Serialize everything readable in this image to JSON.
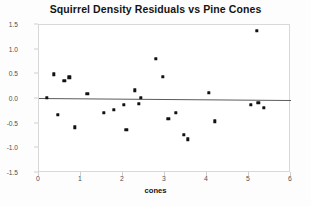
{
  "chart_data": {
    "type": "scatter",
    "title": "Squirrel Density Residuals vs Pine Cones",
    "xlabel": "cones",
    "ylabel": "Residual",
    "xlim": [
      0,
      6
    ],
    "ylim": [
      -1.5,
      1.5
    ],
    "xticks": [
      "0",
      "1",
      "2",
      "3",
      "4",
      "5",
      "6"
    ],
    "xtick_values": [
      0,
      1,
      2,
      3,
      4,
      5,
      6
    ],
    "yticks": [
      "-1.5",
      "-1.0",
      "-0.5",
      "0.0",
      "0.5",
      "1.0",
      "1.5"
    ],
    "ytick_values": [
      -1.5,
      -1.0,
      -0.5,
      0.0,
      0.5,
      1.0,
      1.5
    ],
    "grid": false,
    "legend": null,
    "marker_color": "#111111",
    "reference_line": {
      "name": "zero-residual-line",
      "y_left": 0.02,
      "y_right": -0.02,
      "color": "#5a5a5a"
    },
    "points": [
      {
        "x": 0.18,
        "y": 0.02
      },
      {
        "x": 0.35,
        "y": 0.5
      },
      {
        "x": 0.45,
        "y": -0.32
      },
      {
        "x": 0.6,
        "y": 0.37
      },
      {
        "x": 0.72,
        "y": 0.44
      },
      {
        "x": 0.85,
        "y": -0.57
      },
      {
        "x": 1.15,
        "y": 0.1
      },
      {
        "x": 1.55,
        "y": -0.28
      },
      {
        "x": 1.78,
        "y": -0.22
      },
      {
        "x": 2.02,
        "y": -0.12
      },
      {
        "x": 2.08,
        "y": -0.62
      },
      {
        "x": 2.28,
        "y": 0.18
      },
      {
        "x": 2.38,
        "y": -0.1
      },
      {
        "x": 2.42,
        "y": 0.02
      },
      {
        "x": 2.78,
        "y": 0.82
      },
      {
        "x": 2.95,
        "y": 0.45
      },
      {
        "x": 3.08,
        "y": -0.4
      },
      {
        "x": 3.25,
        "y": -0.28
      },
      {
        "x": 3.45,
        "y": -0.72
      },
      {
        "x": 3.55,
        "y": -0.82
      },
      {
        "x": 4.05,
        "y": 0.12
      },
      {
        "x": 4.18,
        "y": -0.45
      },
      {
        "x": 5.05,
        "y": -0.12
      },
      {
        "x": 5.18,
        "y": 1.38
      },
      {
        "x": 5.22,
        "y": -0.08
      },
      {
        "x": 5.35,
        "y": -0.18
      }
    ]
  }
}
